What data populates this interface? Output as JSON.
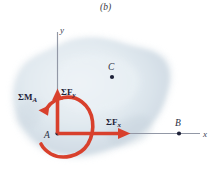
{
  "figure": {
    "caption": "(b)",
    "title_note": "Free-body diagram showing resultant force components and couple moment at point A",
    "colors": {
      "force_red": "#d8402c",
      "axis_gray": "#8a8f9e",
      "body_fill": "#dfe6ec",
      "body_fill_2": "#cfd9e2",
      "label_dark": "#20243a",
      "background": "#ffffff"
    },
    "axes": {
      "x_label": "x",
      "y_label": "y",
      "origin_label": "A"
    },
    "points": [
      {
        "name": "A",
        "label": "A"
      },
      {
        "name": "B",
        "label": "B"
      },
      {
        "name": "C",
        "label": "C"
      }
    ],
    "vectors": [
      {
        "name": "sum-fx",
        "sigma": "Σ",
        "symbol": "F",
        "subscript": "x",
        "direction": "right"
      },
      {
        "name": "sum-fy",
        "sigma": "Σ",
        "symbol": "F",
        "subscript": "y",
        "direction": "up"
      },
      {
        "name": "sum-ma",
        "sigma": "Σ",
        "symbol": "M",
        "subscript": "A",
        "direction": "counterclockwise"
      }
    ]
  }
}
